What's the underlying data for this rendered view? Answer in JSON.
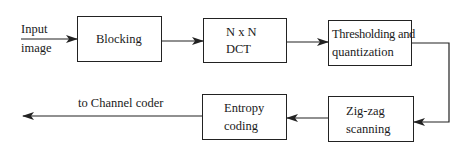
{
  "diagram": {
    "type": "block-diagram",
    "title": "",
    "input_label_line1": "Input",
    "input_label_line2": "image",
    "output_label": "to Channel coder",
    "blocks": [
      {
        "id": "blocking",
        "line1": "Blocking",
        "line2": ""
      },
      {
        "id": "dct",
        "line1": "N x N",
        "line2": "DCT"
      },
      {
        "id": "threshold",
        "line1": "Thresholding and",
        "line2": "quantization"
      },
      {
        "id": "zigzag",
        "line1": "Zig-zag",
        "line2": "scanning"
      },
      {
        "id": "entropy",
        "line1": "Entropy",
        "line2": "coding"
      }
    ],
    "edges": [
      {
        "from": "input",
        "to": "blocking"
      },
      {
        "from": "blocking",
        "to": "dct"
      },
      {
        "from": "dct",
        "to": "threshold"
      },
      {
        "from": "threshold",
        "to": "zigzag"
      },
      {
        "from": "zigzag",
        "to": "entropy"
      },
      {
        "from": "entropy",
        "to": "output"
      }
    ],
    "colors": {
      "stroke": "#222222",
      "background": "#ffffff"
    }
  }
}
